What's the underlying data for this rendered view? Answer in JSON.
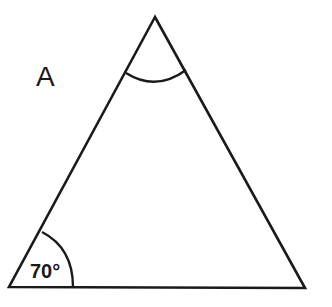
{
  "diagram": {
    "type": "triangle",
    "label": "A",
    "angles": [
      {
        "vertex": "bottom-left",
        "value": "70°",
        "marked": true
      },
      {
        "vertex": "apex",
        "value": "",
        "marked": true
      },
      {
        "vertex": "bottom-right",
        "value": "",
        "marked": false
      }
    ],
    "colors": {
      "stroke": "#1a1a1a",
      "background": "#ffffff"
    }
  }
}
